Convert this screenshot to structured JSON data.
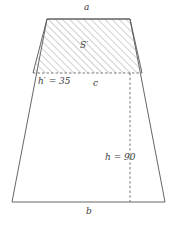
{
  "figure": {
    "type": "geometry-diagram",
    "shape": "trapezoid-with-hatched-upper-trapezoid",
    "stroke_color": "#555555",
    "hatch_color": "#888888",
    "label_color": "#3a3a3a",
    "background_color": "#ffffff",
    "labels": {
      "top_side": "a",
      "hatched_area": "S′",
      "small_height": "h′ = 35",
      "mid_side": "c",
      "full_height": "h = 90",
      "bottom_side": "b"
    },
    "values": {
      "small_height_value": 35,
      "full_height_value": 90
    },
    "geometry": {
      "outer_trapezoid": [
        [
          47,
          19
        ],
        [
          130,
          19
        ],
        [
          165,
          202
        ],
        [
          12,
          202
        ]
      ],
      "hatched_trapezoid": [
        [
          47,
          19
        ],
        [
          130,
          19
        ],
        [
          142,
          73
        ],
        [
          33,
          73
        ]
      ],
      "mid_dashed_line": [
        [
          33,
          73
        ],
        [
          142,
          73
        ]
      ],
      "height_dashed_line": [
        [
          130,
          73
        ],
        [
          130,
          202
        ]
      ]
    }
  }
}
